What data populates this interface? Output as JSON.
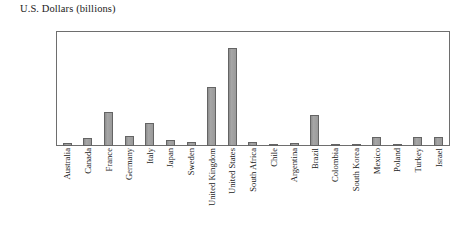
{
  "chart_data": {
    "type": "bar",
    "title": "U.S. Dollars (billions)",
    "xlabel": "",
    "ylabel": "U.S. Dollars (billions)",
    "ylim": [
      0,
      800
    ],
    "yticks": [
      0,
      100,
      200,
      300,
      400,
      500,
      600,
      700,
      800
    ],
    "grid": false,
    "legend": null,
    "bar_color": "#9b9b9b",
    "bar_border_color": "#646464",
    "frame_color": "#6e6e6e",
    "categories": [
      "Australia",
      "Canada",
      "France",
      "Germany",
      "Italy",
      "Japan",
      "Sweden",
      "United Kingdom",
      "United States",
      "South Africa",
      "Chile",
      "Argentina",
      "Brazil",
      "Colombia",
      "South Korea",
      "Mexico",
      "Poland",
      "Turkey",
      "Israel"
    ],
    "values": [
      20,
      55,
      240,
      70,
      160,
      40,
      30,
      410,
      680,
      25,
      15,
      20,
      215,
      8,
      10,
      65,
      8,
      60,
      65
    ]
  }
}
